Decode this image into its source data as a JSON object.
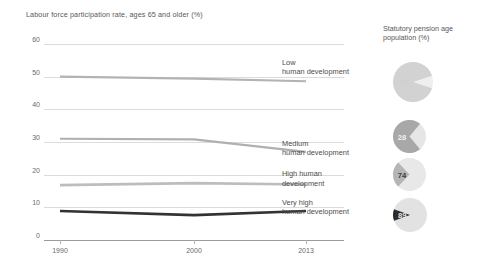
{
  "chart_data": {
    "type": "line",
    "title": "Labour force participation rate, ages 65 and older (%)",
    "xlabel": "",
    "ylabel": "",
    "x": [
      1990,
      2000,
      2013
    ],
    "xticklabels": [
      "1990",
      "2000",
      "2013"
    ],
    "yticks": [
      0,
      10,
      20,
      30,
      40,
      50,
      60
    ],
    "yticklabels": [
      "0",
      "10",
      "20",
      "30",
      "40",
      "50",
      "60"
    ],
    "ylim": [
      0,
      60
    ],
    "xlim": [
      1990,
      2013
    ],
    "grid": true,
    "legend": "inline-right-of-series",
    "series": [
      {
        "name": "Low\nhuman development",
        "label_line1": "Low",
        "label_line2": "human development",
        "values": [
          50.0,
          49.4,
          48.6
        ],
        "color": "#b3b3b3",
        "width": 2.2
      },
      {
        "name": "Medium\nhuman development",
        "label_line1": "Medium",
        "label_line2": "human development",
        "values": [
          31.0,
          30.8,
          27.0
        ],
        "color": "#b0b0b0",
        "width": 2.2
      },
      {
        "name": "High human\ndevelopment",
        "label_line1": "High human",
        "label_line2": "development",
        "values": [
          16.8,
          17.4,
          17.0
        ],
        "color": "#bdbdbd",
        "width": 2.6
      },
      {
        "name": "Very high\nhuman development",
        "label_line1": "Very high",
        "label_line2": "human development",
        "values": [
          8.9,
          7.6,
          8.9
        ],
        "color": "#333333",
        "width": 2.6
      }
    ]
  },
  "side_panel": {
    "title_line1": "Statutory pension age",
    "title_line2": "population (%)",
    "title": "Statutory pension age population (%)",
    "pies": [
      {
        "group": "Low human development",
        "value": 10,
        "label": "10",
        "fill": "#d2d2d2",
        "track": "#efefef",
        "text_color": "#cfcfcf"
      },
      {
        "group": "Medium human development",
        "value": 28,
        "label": "28",
        "fill": "#a8a8a8",
        "track": "#e6e6e6",
        "text_color": "#f0f0f0"
      },
      {
        "group": "High human development",
        "value": 74,
        "label": "74",
        "fill": "#b5b5b5",
        "track": "#e8e8e8",
        "text_color": "#3d3d3d"
      },
      {
        "group": "Very high human development",
        "value": 89,
        "label": "89",
        "fill": "#2b2b2b",
        "track": "#e2e2e2",
        "text_color": "#e8e8e8"
      }
    ]
  },
  "colors": {
    "background": "#ffffff",
    "gridline": "#dcdcdc",
    "axis": "#9b9b9b",
    "text": "#58585a",
    "dark_series": "#333333"
  }
}
